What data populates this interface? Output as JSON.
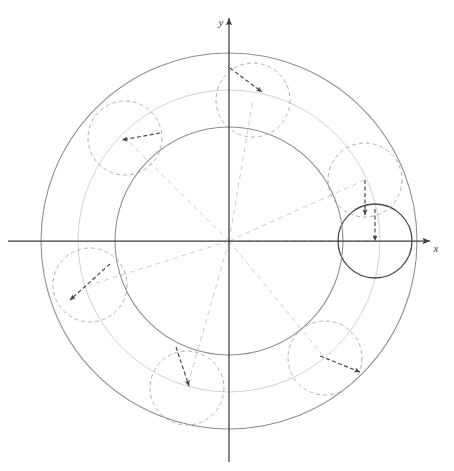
{
  "figure": {
    "background_color": "#ffffff",
    "width": 454,
    "height": 471
  },
  "axes": {
    "origin": {
      "x": 229,
      "y": 241
    },
    "x_axis": {
      "label": "x",
      "label_position": {
        "x": 436,
        "y": 252
      },
      "start": {
        "x": 8,
        "y": 241
      },
      "end": {
        "x": 430,
        "y": 241
      },
      "color": "#3c3c3c",
      "arrow": "right"
    },
    "y_axis": {
      "label": "y",
      "label_position": {
        "x": 221,
        "y": 26
      },
      "start": {
        "x": 229,
        "y": 462
      },
      "end": {
        "x": 229,
        "y": 18
      },
      "color": "#3c3c3c",
      "arrow": "up"
    }
  },
  "chart_data": {
    "type": "scatter",
    "xlabel": "x",
    "ylabel": "y",
    "grid": false,
    "legend": null,
    "base_circle": {
      "name": "fixed base circle",
      "center": {
        "x": 229,
        "y": 241
      },
      "radius": 114,
      "style": "solid",
      "color": "#8d8d8d"
    },
    "outer_circle": {
      "name": "outer envelope circle",
      "center": {
        "x": 229,
        "y": 241
      },
      "radius": 188,
      "style": "solid",
      "color": "#8d8d8d"
    },
    "faint_circle": {
      "name": "faint guide circle",
      "center": {
        "x": 229,
        "y": 241
      },
      "radius": 151,
      "style": "solid",
      "color": "#cfcfcf"
    },
    "rolling_radius": 37,
    "rolling_circles": [
      {
        "index": 0,
        "center": {
          "x": 375,
          "y": 241
        },
        "angle_deg": 0,
        "style": "solid-dark",
        "color": "#4a4a4a"
      },
      {
        "index": 1,
        "center": {
          "x": 365,
          "y": 180
        },
        "angle_deg": 31,
        "style": "dashed",
        "color": "#b2b2b2"
      },
      {
        "index": 2,
        "center": {
          "x": 253,
          "y": 100
        },
        "angle_deg": 84,
        "style": "dashed",
        "color": "#b2b2b2"
      },
      {
        "index": 3,
        "center": {
          "x": 125,
          "y": 138
        },
        "angle_deg": 140,
        "style": "dashed",
        "color": "#b2b2b2"
      },
      {
        "index": 4,
        "center": {
          "x": 90,
          "y": 285
        },
        "angle_deg": 196,
        "style": "dashed",
        "color": "#b2b2b2"
      },
      {
        "index": 5,
        "center": {
          "x": 187,
          "y": 388
        },
        "angle_deg": 250,
        "style": "dashed",
        "color": "#b2b2b2"
      },
      {
        "index": 6,
        "center": {
          "x": 325,
          "y": 358
        },
        "angle_deg": 309,
        "style": "dashed",
        "color": "#b2b2b2"
      }
    ],
    "radial_guides": [
      {
        "from": {
          "x": 229,
          "y": 241
        },
        "to": {
          "x": 375,
          "y": 241
        },
        "angle_deg": 0
      },
      {
        "from": {
          "x": 229,
          "y": 241
        },
        "to": {
          "x": 365,
          "y": 180
        },
        "angle_deg": 24
      },
      {
        "from": {
          "x": 229,
          "y": 241
        },
        "to": {
          "x": 253,
          "y": 100
        },
        "angle_deg": 80
      },
      {
        "from": {
          "x": 229,
          "y": 241
        },
        "to": {
          "x": 125,
          "y": 138
        },
        "angle_deg": 135
      },
      {
        "from": {
          "x": 229,
          "y": 241
        },
        "to": {
          "x": 90,
          "y": 285
        },
        "angle_deg": 198
      },
      {
        "from": {
          "x": 229,
          "y": 241
        },
        "to": {
          "x": 187,
          "y": 388
        },
        "angle_deg": 254
      },
      {
        "from": {
          "x": 229,
          "y": 241
        },
        "to": {
          "x": 325,
          "y": 358
        },
        "angle_deg": 309
      }
    ],
    "tracing_arrows": [
      {
        "index": 0,
        "from": {
          "x": 375,
          "y": 209
        },
        "to": {
          "x": 375,
          "y": 241
        },
        "note": "radius vector on solid circle"
      },
      {
        "index": 1,
        "from": {
          "x": 365,
          "y": 180
        },
        "to": {
          "x": 365,
          "y": 215
        },
        "note": "radius vector pointing down"
      },
      {
        "index": 2,
        "from": {
          "x": 230,
          "y": 68
        },
        "to": {
          "x": 262,
          "y": 92
        },
        "note": "radius vector pointing down-right"
      },
      {
        "index": 3,
        "from": {
          "x": 160,
          "y": 133
        },
        "to": {
          "x": 122,
          "y": 140
        },
        "note": "radius vector pointing left"
      },
      {
        "index": 4,
        "from": {
          "x": 110,
          "y": 264
        },
        "to": {
          "x": 70,
          "y": 300
        },
        "note": "radius vector pointing down-left"
      },
      {
        "index": 5,
        "from": {
          "x": 176,
          "y": 347
        },
        "to": {
          "x": 189,
          "y": 386
        },
        "note": "radius vector pointing down"
      },
      {
        "index": 6,
        "from": {
          "x": 320,
          "y": 356
        },
        "to": {
          "x": 360,
          "y": 372
        },
        "note": "radius vector pointing down-right"
      }
    ],
    "cusp_count": 7
  },
  "colors": {
    "axis": "#3c3c3c",
    "base_stroke": "#8d8d8d",
    "rolling_stroke": "#b2b2b2",
    "faint_stroke": "#cfcfcf",
    "guide_stroke": "#cccccc",
    "arrow_stroke": "#444444",
    "dark_circle": "#4a4a4a"
  }
}
